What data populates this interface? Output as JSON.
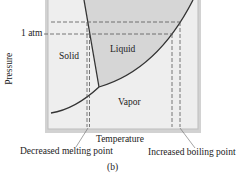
{
  "diagram": {
    "y_axis_label": "Pressure",
    "x_axis_label": "Temperature",
    "pressure_marker": "1 atm",
    "regions": {
      "solid": "Solid",
      "liquid": "Liquid",
      "vapor": "Vapor"
    },
    "annotations": {
      "melting": "Decreased melting point",
      "boiling": "Increased boiling point"
    },
    "caption": "(b)",
    "colors": {
      "frame": "#c8c8c8",
      "plot_bg": "#eeeeee",
      "liquid_fill": "#d6d6d6",
      "curve": "#333333",
      "dashed": "#555555"
    }
  }
}
